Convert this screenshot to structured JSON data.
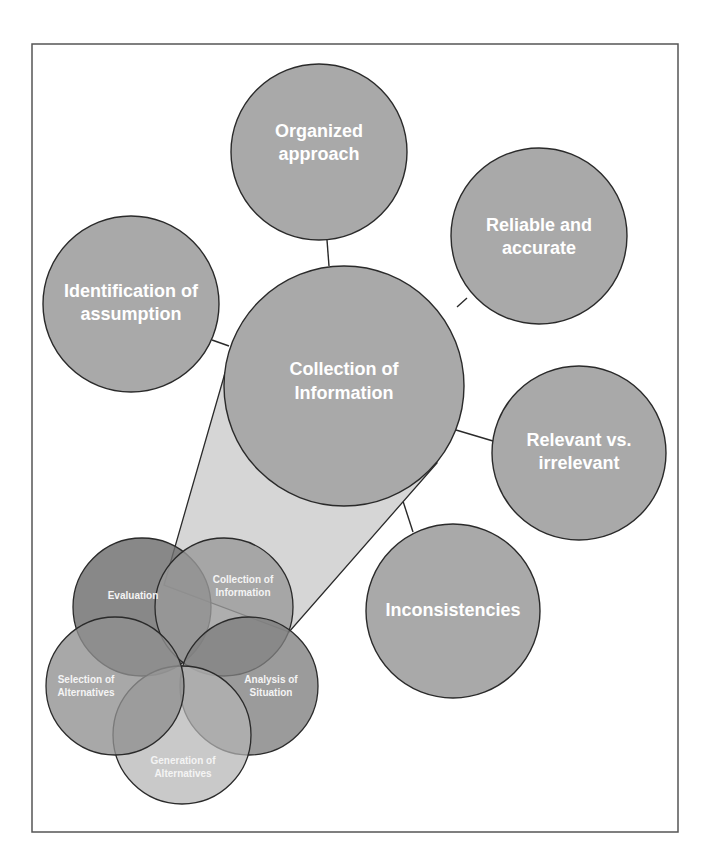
{
  "diagram": {
    "frame": {
      "x": 32,
      "y": 44,
      "width": 646,
      "height": 788,
      "stroke": "#555555"
    },
    "colors": {
      "satellite_fill": "#a9a9a9",
      "hub_fill": "#a9a9a9",
      "cone_fill": "#d6d6d6",
      "outline": "#2a2a2a",
      "label": "#ffffff"
    },
    "hub": {
      "id": "collection-of-information",
      "label_lines": [
        "Collection of",
        "Information"
      ],
      "cx": 344,
      "cy": 386,
      "r": 120
    },
    "satellites": [
      {
        "id": "organized-approach",
        "label_lines": [
          "Organized",
          "approach"
        ],
        "cx": 319,
        "cy": 152,
        "r": 88
      },
      {
        "id": "reliable-and-accurate",
        "label_lines": [
          "Reliable and",
          "accurate"
        ],
        "cx": 539,
        "cy": 236,
        "r": 88
      },
      {
        "id": "identification-of-assumption",
        "label_lines": [
          "Identification of",
          "assumption"
        ],
        "cx": 131,
        "cy": 304,
        "r": 88
      },
      {
        "id": "relevant-vs-irrelevant",
        "label_lines": [
          "Relevant vs.",
          "irrelevant"
        ],
        "cx": 579,
        "cy": 453,
        "r": 87
      },
      {
        "id": "inconsistencies",
        "label_lines": [
          "Inconsistencies"
        ],
        "cx": 453,
        "cy": 611,
        "r": 87
      }
    ],
    "connectors": [
      {
        "to": "organized-approach",
        "x1": 327,
        "y1": 240,
        "x2": 329,
        "y2": 266
      },
      {
        "to": "reliable-and-accurate",
        "x1": 457,
        "y1": 307,
        "x2": 467,
        "y2": 298
      },
      {
        "to": "identification-of-assumption",
        "x1": 212,
        "y1": 340,
        "x2": 229,
        "y2": 346
      },
      {
        "to": "relevant-vs-irrelevant",
        "x1": 456,
        "y1": 430,
        "x2": 493,
        "y2": 441
      },
      {
        "to": "inconsistencies",
        "x1": 400,
        "y1": 492,
        "x2": 413,
        "y2": 532
      }
    ],
    "cone": {
      "points": "225,373 164,585 289,632 437,463"
    },
    "cycle": {
      "center": {
        "x": 183,
        "y": 665
      },
      "petals": [
        {
          "id": "evaluation",
          "label_lines": [
            "Evaluation"
          ],
          "cx": 142,
          "cy": 607,
          "r": 69,
          "fill": "#6e6e6e",
          "opacity": 0.82
        },
        {
          "id": "collection-of-information",
          "label_lines": [
            "Collection of",
            "Information"
          ],
          "cx": 224,
          "cy": 607,
          "r": 69,
          "fill": "#9a9a9a",
          "opacity": 0.8
        },
        {
          "id": "analysis-of-situation",
          "label_lines": [
            "Analysis of",
            "Situation"
          ],
          "cx": 249,
          "cy": 686,
          "r": 69,
          "fill": "#7f7f7f",
          "opacity": 0.78
        },
        {
          "id": "generation-of-alternatives",
          "label_lines": [
            "Generation of",
            "Alternatives"
          ],
          "cx": 182,
          "cy": 735,
          "r": 69,
          "fill": "#b4b4b4",
          "opacity": 0.72
        },
        {
          "id": "selection-of-alternatives",
          "label_lines": [
            "Selection of",
            "Alternatives"
          ],
          "cx": 115,
          "cy": 686,
          "r": 69,
          "fill": "#909090",
          "opacity": 0.78
        }
      ],
      "label_positions": {
        "evaluation": {
          "x": 133,
          "y": 596
        },
        "collection-of-information": {
          "x": 243,
          "y": 587
        },
        "analysis-of-situation": {
          "x": 271,
          "y": 687
        },
        "generation-of-alternatives": {
          "x": 183,
          "y": 768
        },
        "selection-of-alternatives": {
          "x": 86,
          "y": 687
        }
      }
    }
  }
}
